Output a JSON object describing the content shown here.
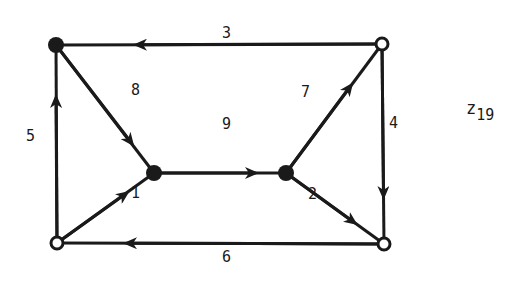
{
  "diagram": {
    "title": {
      "base": "z",
      "subscript": "19"
    },
    "colors": {
      "stroke": "#1a1a1a",
      "background": "#ffffff"
    },
    "nodes": [
      {
        "id": "TL",
        "x": 56,
        "y": 45,
        "type": "filled"
      },
      {
        "id": "TR",
        "x": 382,
        "y": 44,
        "type": "hollow"
      },
      {
        "id": "BL",
        "x": 57,
        "y": 243,
        "type": "hollow"
      },
      {
        "id": "BR",
        "x": 384,
        "y": 244,
        "type": "hollow"
      },
      {
        "id": "ML",
        "x": 154,
        "y": 173,
        "type": "filled"
      },
      {
        "id": "MR",
        "x": 286,
        "y": 173,
        "type": "filled"
      }
    ],
    "edges": [
      {
        "label": "1",
        "from": "BL",
        "to": "ML"
      },
      {
        "label": "2",
        "from": "MR",
        "to": "BR"
      },
      {
        "label": "3",
        "from": "TR",
        "to": "TL"
      },
      {
        "label": "4",
        "from": "TR",
        "to": "BR"
      },
      {
        "label": "5",
        "from": "BL",
        "to": "TL"
      },
      {
        "label": "6",
        "from": "BR",
        "to": "BL"
      },
      {
        "label": "7",
        "from": "MR",
        "to": "TR"
      },
      {
        "label": "8",
        "from": "TL",
        "to": "ML"
      },
      {
        "label": "9",
        "from": "ML",
        "to": "MR"
      }
    ]
  }
}
